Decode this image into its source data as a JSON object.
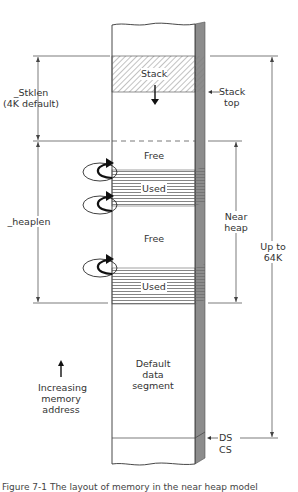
{
  "diagram": {
    "segments": [
      {
        "id": "stack",
        "label": "Stack",
        "pattern": "diagonal-hatch"
      },
      {
        "id": "free1",
        "label": "Free"
      },
      {
        "id": "used1",
        "label": "Used",
        "pattern": "horizontal-lines"
      },
      {
        "id": "free2",
        "label": "Free"
      },
      {
        "id": "used2",
        "label": "Used",
        "pattern": "horizontal-lines"
      },
      {
        "id": "default",
        "label_lines": [
          "Default",
          "data",
          "segment"
        ]
      }
    ],
    "pointers": {
      "stack_top": [
        "Stack",
        "top"
      ],
      "ds": "DS",
      "cs": "CS"
    },
    "dimensions": {
      "stklen": [
        "_Stklen",
        "(4K default)"
      ],
      "heaplen": "_heaplen",
      "near_heap": [
        "Near",
        "heap"
      ],
      "up_to_64k": [
        "Up to",
        "64K"
      ]
    },
    "legend": {
      "increasing_memory": [
        "Increasing",
        "memory",
        "address"
      ]
    },
    "caption": "Figure 7-1   The layout of memory in the near heap model"
  }
}
